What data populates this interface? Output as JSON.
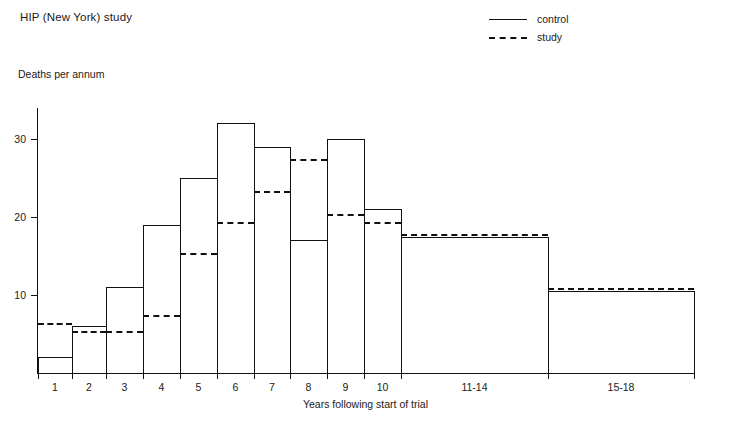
{
  "title": "HIP (New York) study",
  "legend": {
    "items": [
      {
        "label": "control",
        "style": "solid"
      },
      {
        "label": "study",
        "style": "dashed"
      }
    ]
  },
  "axes": {
    "ylabel": "Deaths per annum",
    "xlabel": "Years following start of trial",
    "yticks": [
      "10",
      "20",
      "30"
    ],
    "xticklabels": [
      "1",
      "2",
      "3",
      "4",
      "5",
      "6",
      "7",
      "8",
      "9",
      "10",
      "11-14",
      "15-18"
    ]
  },
  "chart_data": {
    "type": "bar",
    "title": "HIP (New York) study",
    "xlabel": "Years following start of trial",
    "ylabel": "Deaths per annum",
    "categories": [
      "1",
      "2",
      "3",
      "4",
      "5",
      "6",
      "7",
      "8",
      "9",
      "10",
      "11-14",
      "15-18"
    ],
    "series": [
      {
        "name": "control",
        "style": "solid",
        "values": [
          2,
          6,
          11,
          19,
          25,
          32,
          29,
          17,
          30,
          21,
          17.5,
          10.5
        ]
      },
      {
        "name": "study",
        "style": "dashed",
        "values": [
          6,
          5,
          5,
          7,
          15,
          19,
          23,
          27,
          20,
          19,
          17.5,
          10.5
        ]
      }
    ],
    "ylim": [
      0,
      36
    ],
    "ytick_values": [
      10,
      20,
      30
    ],
    "grid": false,
    "legend_position": "top-right",
    "note": "Last two categories (11-14, 15-18) span multiple years and are drawn as wide bars."
  },
  "geometry": {
    "baseline_y": 373,
    "pixels_per_unit": 7.8,
    "bar_edges_x": [
      38,
      72,
      106,
      143,
      180,
      217,
      254,
      290,
      327,
      364,
      401,
      548,
      694
    ]
  }
}
